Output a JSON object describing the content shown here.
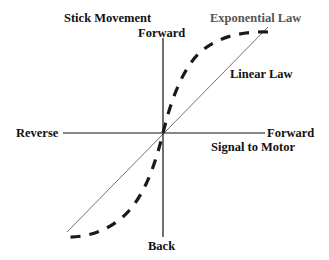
{
  "diagram": {
    "title": "Stick Movement",
    "axes": {
      "vertical": {
        "top_label": "Forward",
        "bottom_label": "Back",
        "name": "Stick Movement"
      },
      "horizontal": {
        "left_label": "Reverse",
        "right_label": "Forward",
        "name": "Signal to Motor"
      }
    },
    "curves": [
      {
        "name": "Exponential Law",
        "style": "dashed",
        "color": "#222222"
      },
      {
        "name": "Linear Law",
        "style": "solid-thin",
        "color": "#333333"
      }
    ],
    "colors": {
      "axis": "#111111",
      "text": "#111111",
      "exp_label": "#555555"
    }
  }
}
